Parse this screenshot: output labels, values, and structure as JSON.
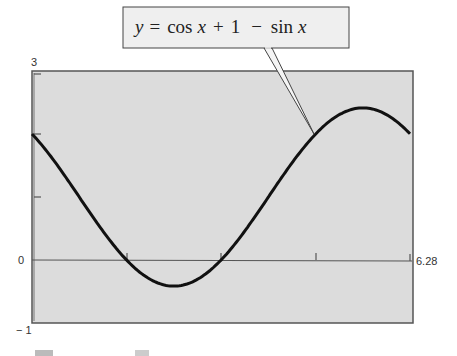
{
  "chart_data": {
    "type": "line",
    "title": "",
    "annotation": "y = cos x + 1 − sin x",
    "series": [
      {
        "name": "y = cos x + 1 - sin x",
        "function": "cos(x) + 1 - sin(x)"
      }
    ],
    "x": [
      0,
      0.785,
      1.571,
      2.356,
      3.142,
      3.927,
      4.712,
      5.498,
      6.28
    ],
    "values": [
      2.0,
      1.0,
      0.0,
      -0.414,
      0.0,
      1.0,
      2.0,
      2.414,
      2.0
    ],
    "xlim": [
      0,
      6.28
    ],
    "ylim": [
      -1,
      3
    ],
    "x_ticks": [
      1.571,
      3.142,
      4.712,
      6.28
    ],
    "y_ticks": [
      1,
      2
    ],
    "tick_labels": {
      "ymax": "3",
      "ymin": "− 1",
      "yzero": "0",
      "xmax": "6.28"
    },
    "xlabel": "",
    "ylabel": "",
    "grid": false,
    "legend": "none"
  },
  "callout": {
    "y": "y",
    "eq": "=",
    "cos": "cos",
    "x1": "x",
    "plus": "+",
    "one": "1",
    "minus": "−",
    "sin": "sin",
    "x2": "x"
  },
  "labels": {
    "ymax": "3",
    "yzero": "0",
    "ymin": "− 1",
    "xmax": "6.28"
  },
  "colors": {
    "plot_bg": "#dcdcdc",
    "curve": "#111111",
    "axis": "#444444",
    "callout_bg": "#efefef"
  }
}
